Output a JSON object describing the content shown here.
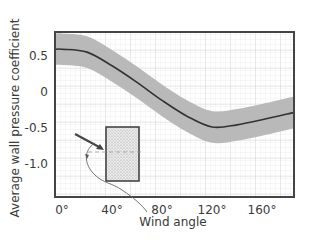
{
  "chart_data": {
    "type": "line",
    "title": "",
    "xlabel": "Wind angle",
    "ylabel": "Average wall pressure coefficient",
    "xlim": [
      -5,
      185
    ],
    "ylim": [
      -1.45,
      0.8
    ],
    "x_ticks": [
      0,
      40,
      80,
      120,
      160
    ],
    "x_tick_labels": [
      "0°",
      "40°",
      "80°",
      "120°",
      "160°"
    ],
    "y_ticks": [
      0.5,
      0,
      -0.5,
      -1.0
    ],
    "y_tick_labels": [
      "0.5",
      "0",
      "-0.5",
      "-1.0"
    ],
    "grid": true,
    "legend": null,
    "series": [
      {
        "name": "mean",
        "x": [
          -5,
          0,
          20,
          40,
          60,
          80,
          100,
          120,
          140,
          160,
          185
        ],
        "values": [
          0.58,
          0.58,
          0.54,
          0.35,
          0.12,
          -0.13,
          -0.35,
          -0.5,
          -0.47,
          -0.4,
          -0.3
        ],
        "color": "#333333"
      },
      {
        "name": "band",
        "type": "area",
        "half_width": 0.22,
        "color": "#b5b5b5"
      }
    ],
    "annotations": [
      {
        "type": "inset",
        "description": "Rectangular building plan with wind arrow and angle arc",
        "label": "Wind angle"
      }
    ]
  },
  "labels": {
    "ylabel": "Average wall pressure coefficient",
    "xlabel": "Wind angle"
  }
}
